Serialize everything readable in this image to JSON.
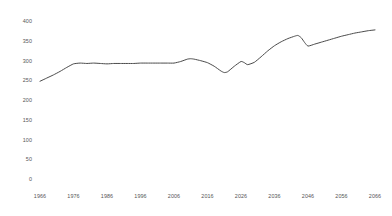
{
  "chart_data": {
    "type": "line",
    "title": "",
    "subtitle": "",
    "xlabel": "",
    "ylabel": "",
    "xlim": [
      1966,
      2066
    ],
    "ylim": [
      0,
      400
    ],
    "grid": false,
    "legend": false,
    "legend_position": "none",
    "line_color": "#4a4a4a",
    "tick_label_color": "#555555",
    "background_color": "#ffffff",
    "y_ticks": [
      0,
      50,
      100,
      150,
      200,
      250,
      300,
      350,
      400
    ],
    "y_tick_labels": [
      "0",
      "50",
      "100",
      "150",
      "200",
      "250",
      "300",
      "350",
      "400"
    ],
    "x_ticks": [
      1966,
      1976,
      1986,
      1996,
      2006,
      2016,
      2026,
      2036,
      2046,
      2056,
      2066
    ],
    "x_tick_labels": [
      "1966",
      "1976",
      "1986",
      "1996",
      "2006",
      "2016",
      "2026",
      "2036",
      "2046",
      "2056",
      "2066"
    ],
    "series": [
      {
        "name": "series-1",
        "color": "#4a4a4a",
        "x": [
          1966,
          1968,
          1970,
          1972,
          1974,
          1976,
          1978,
          1980,
          1982,
          1984,
          1986,
          1988,
          1990,
          1992,
          1994,
          1996,
          1998,
          2000,
          2002,
          2004,
          2006,
          2008,
          2010,
          2011,
          2012,
          2014,
          2016,
          2018,
          2020,
          2021,
          2022,
          2024,
          2026,
          2027,
          2028,
          2030,
          2032,
          2034,
          2036,
          2038,
          2040,
          2042,
          2043,
          2044,
          2045,
          2046,
          2048,
          2050,
          2052,
          2054,
          2056,
          2058,
          2060,
          2062,
          2064,
          2066
        ],
        "y": [
          250,
          258,
          266,
          275,
          285,
          294,
          296,
          295,
          296,
          295,
          294,
          295,
          295,
          295,
          295,
          296,
          296,
          296,
          296,
          296,
          296,
          300,
          306,
          307,
          306,
          302,
          297,
          288,
          276,
          272,
          274,
          288,
          300,
          297,
          292,
          298,
          312,
          327,
          340,
          350,
          358,
          364,
          366,
          360,
          348,
          339,
          344,
          349,
          354,
          359,
          364,
          368,
          372,
          375,
          378,
          380
        ]
      }
    ]
  }
}
